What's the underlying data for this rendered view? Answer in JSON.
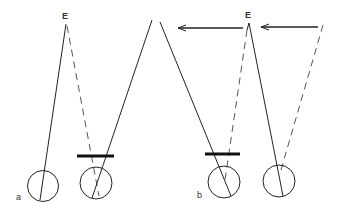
{
  "diagram": {
    "type": "optics-eye-alignment",
    "panels": [
      {
        "id": "a",
        "label": "a",
        "target_label": "E",
        "elements": [
          "left-eye",
          "right-eye-with-occluder",
          "solid-visual-axis",
          "dashed-visual-axis"
        ]
      },
      {
        "id": "b",
        "label": "b",
        "target_label": "E",
        "elements": [
          "left-eye-with-occluder",
          "right-eye",
          "solid-visual-axis",
          "dashed-visual-axes",
          "leftward-arrows"
        ]
      }
    ],
    "colors": {
      "line": "#222222",
      "dashed": "#555555",
      "background": "#ffffff"
    }
  }
}
